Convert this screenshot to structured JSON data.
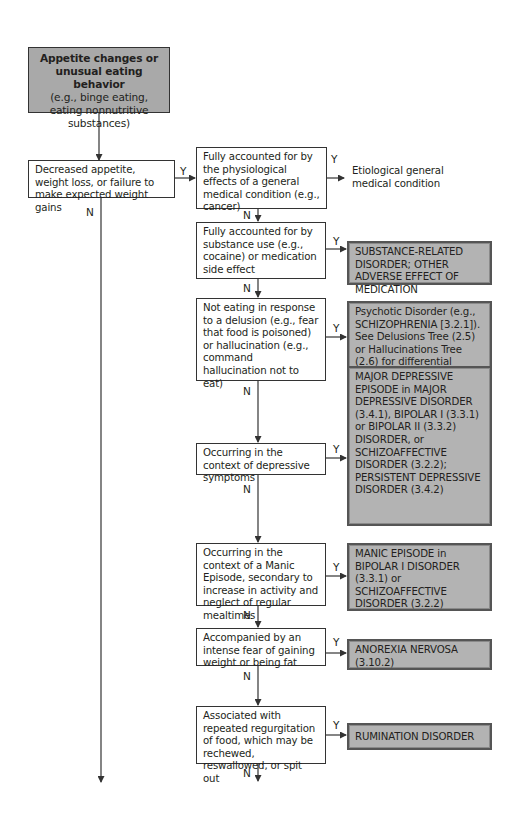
{
  "start": {
    "title": "Appetite changes or unusual eating behavior",
    "subtitle": "(e.g., binge eating, eating nonnutritive substances)"
  },
  "left_node": {
    "text": "Decreased appetite, weight loss, or failure to make expected weight gains",
    "yes_label": "Y",
    "no_label": "N"
  },
  "decisions": [
    {
      "text": "Fully accounted for by the physiological effects of a general medical condition (e.g., cancer)",
      "yes": "Y",
      "no": "N"
    },
    {
      "text": "Fully accounted for by substance use (e.g., cocaine) or medication side effect",
      "yes": "Y",
      "no": "N"
    },
    {
      "text": "Not eating in response to a delusion (e.g., fear that food is poisoned) or hallucination (e.g., command hallucination not to eat)",
      "yes": "Y",
      "no": "N"
    },
    {
      "text": "Occurring in the context of depressive symptoms",
      "yes": "Y",
      "no": "N"
    },
    {
      "text": "Occurring in the context of a Manic Episode, secondary to increase in activity and neglect of regular mealtimes",
      "yes": "Y",
      "no": "N"
    },
    {
      "text": "Accompanied by an intense fear of gaining weight or being fat",
      "yes": "Y",
      "no": "N"
    },
    {
      "text": "Associated with repeated regurgitation of food, which may be rechewed, reswallowed, or spit out",
      "yes": "Y",
      "no": "N"
    }
  ],
  "outcomes": [
    {
      "text": "Etiological general medical condition",
      "style": "plain"
    },
    {
      "text": "SUBSTANCE-RELATED DISORDER; OTHER ADVERSE EFFECT OF MEDICATION",
      "style": "shaded"
    },
    {
      "text": "Psychotic Disorder (e.g., SCHIZOPHRENIA [3.2.1]). See Delusions Tree (2.5) or Hallucinations Tree (2.6) for differential diagnosis",
      "style": "shaded"
    },
    {
      "text": "MAJOR DEPRESSIVE EPISODE in MAJOR DEPRESSIVE DISORDER (3.4.1), BIPOLAR I (3.3.1) or BIPOLAR II (3.3.2) DISORDER, or SCHIZOAFFECTIVE DISORDER (3.2.2); PERSISTENT DEPRESSIVE DISORDER (3.4.2)",
      "style": "shaded"
    },
    {
      "text": "MANIC EPISODE in BIPOLAR I DISORDER (3.3.1) or SCHIZOAFFECTIVE DISORDER (3.2.2)",
      "style": "shaded"
    },
    {
      "text": "ANOREXIA NERVOSA (3.10.2)",
      "style": "shaded"
    },
    {
      "text": "RUMINATION DISORDER",
      "style": "shaded"
    }
  ],
  "colors": {
    "shaded_fill": "#b3b3b3",
    "start_fill": "#a9a9a9",
    "line": "#333333"
  }
}
